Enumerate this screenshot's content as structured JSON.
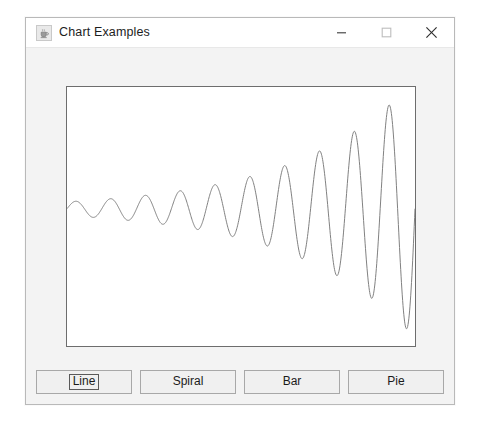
{
  "window": {
    "title": "Chart Examples",
    "icon": "java-coffee-cup-icon",
    "controls": {
      "minimize": "–",
      "maximize": "□",
      "close": "✕"
    }
  },
  "buttons": [
    {
      "label": "Line",
      "name": "line-chart-button",
      "focused": true
    },
    {
      "label": "Spiral",
      "name": "spiral-chart-button",
      "focused": false
    },
    {
      "label": "Bar",
      "name": "bar-chart-button",
      "focused": false
    },
    {
      "label": "Pie",
      "name": "pie-chart-button",
      "focused": false
    }
  ],
  "chart_data": {
    "type": "line",
    "title": "",
    "xlabel": "",
    "ylabel": "",
    "grid": false,
    "legend": false,
    "line_color": "#808080",
    "background": "#ffffff",
    "border_color": "#6d6d6d",
    "xlim": [
      0,
      350
    ],
    "ylim": [
      0,
      261
    ],
    "baseline_y_fraction": 0.47,
    "x": [
      0,
      3.5,
      7,
      10.5,
      14,
      17.5,
      21,
      24.5,
      28,
      31.5,
      35,
      38.5,
      42,
      45.5,
      49,
      52.5,
      56,
      59.5,
      63,
      66.5,
      70,
      73.5,
      77,
      80.5,
      84,
      87.5,
      91,
      94.5,
      98,
      101.5,
      105,
      108.5,
      112,
      115.5,
      119,
      122.5,
      126,
      129.5,
      133,
      136.5,
      140,
      143.5,
      147,
      150.5,
      154,
      157.5,
      161,
      164.5,
      168,
      171.5,
      175,
      178.5,
      182,
      185.5,
      189,
      192.5,
      196,
      199.5,
      203,
      206.5,
      210,
      213.5,
      217,
      220.5,
      224,
      227.5,
      231,
      234.5,
      238,
      241.5,
      245,
      248.5,
      252,
      255.5,
      259,
      262.5,
      266,
      269.5,
      273,
      276.5,
      280,
      283.5,
      287,
      290.5,
      294,
      297.5,
      301,
      304.5,
      308,
      311.5,
      315,
      318.5,
      322,
      325.5,
      329,
      332.5,
      336,
      339.5,
      343,
      346.5,
      350
    ],
    "y_values_note": "y = baseline - A(x)*sin(w*x), with A growing ~ (6 + 0.55*x) px and w ~ 0.18 rad/px",
    "amplitude_start_px": 7,
    "amplitude_end_px": 130,
    "cycles": 10
  }
}
